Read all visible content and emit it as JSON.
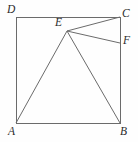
{
  "figure": {
    "kind": "geometry-diagram",
    "canvas": {
      "width": 138,
      "height": 142
    },
    "style": {
      "background_color": "#fefefe",
      "stroke_color": "#6b6b6b",
      "label_color": "#2b2b2b",
      "stroke_width": 1
    },
    "points": {
      "A": {
        "label": "A",
        "x": 16,
        "y": 123
      },
      "B": {
        "label": "B",
        "x": 120,
        "y": 123
      },
      "C": {
        "label": "C",
        "x": 120,
        "y": 17
      },
      "D": {
        "label": "D",
        "x": 16,
        "y": 17
      },
      "E": {
        "label": "E",
        "x": 67,
        "y": 31
      },
      "F": {
        "label": "F",
        "x": 120,
        "y": 43
      }
    },
    "segments": [
      {
        "name": "side-DA",
        "from": "D",
        "to": "A"
      },
      {
        "name": "side-AB",
        "from": "A",
        "to": "B"
      },
      {
        "name": "side-BC",
        "from": "B",
        "to": "C"
      },
      {
        "name": "side-CD",
        "from": "C",
        "to": "D"
      },
      {
        "name": "segment-EA",
        "from": "E",
        "to": "A"
      },
      {
        "name": "segment-EB",
        "from": "E",
        "to": "B"
      },
      {
        "name": "segment-EC",
        "from": "E",
        "to": "C"
      },
      {
        "name": "segment-EF",
        "from": "E",
        "to": "F"
      }
    ]
  }
}
